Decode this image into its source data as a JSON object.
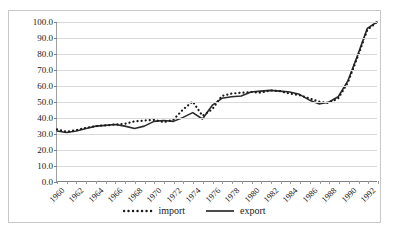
{
  "chart_data": {
    "type": "line",
    "title": "",
    "xlabel": "",
    "ylabel": "",
    "ylim": [
      0,
      100
    ],
    "xlim": [
      1960,
      1993
    ],
    "grid": true,
    "legend_position": "bottom",
    "ytick_labels": [
      "100.0",
      "90.0",
      "80.0",
      "70.0",
      "60.0",
      "50.0",
      "40.0",
      "30.0",
      "20.0",
      "10.0",
      "0.0"
    ],
    "ytick_values": [
      100,
      90,
      80,
      70,
      60,
      50,
      40,
      30,
      20,
      10,
      0
    ],
    "xtick_labels": [
      "1960",
      "1962",
      "1964",
      "1966",
      "1968",
      "1970",
      "1972",
      "1974",
      "1976",
      "1978",
      "1980",
      "1982",
      "1984",
      "1986",
      "1988",
      "1990",
      "1992"
    ],
    "x": [
      1960,
      1961,
      1962,
      1963,
      1964,
      1965,
      1966,
      1967,
      1968,
      1969,
      1970,
      1971,
      1972,
      1973,
      1974,
      1975,
      1976,
      1977,
      1978,
      1979,
      1980,
      1981,
      1982,
      1983,
      1984,
      1985,
      1986,
      1987,
      1988,
      1989,
      1990,
      1991,
      1992,
      1993
    ],
    "series": [
      {
        "name": "import",
        "style": "dotted",
        "color": "#1a1a1a",
        "values": [
          32.5,
          31.0,
          32.0,
          33.5,
          34.5,
          35.0,
          35.5,
          36.0,
          37.5,
          38.0,
          38.5,
          37.0,
          38.5,
          45.0,
          50.0,
          41.0,
          45.0,
          53.5,
          55.0,
          55.5,
          56.0,
          55.5,
          57.0,
          56.5,
          55.0,
          54.0,
          52.0,
          50.0,
          49.0,
          52.0,
          62.0,
          78.0,
          95.0,
          100.0
        ]
      },
      {
        "name": "export",
        "style": "solid",
        "color": "#2b2b2b",
        "values": [
          31.5,
          30.5,
          31.5,
          33.0,
          34.5,
          35.0,
          35.5,
          34.5,
          33.0,
          34.5,
          37.5,
          38.0,
          37.5,
          40.0,
          43.0,
          39.0,
          47.5,
          52.0,
          53.0,
          53.5,
          56.0,
          56.5,
          57.0,
          56.5,
          56.0,
          54.5,
          51.0,
          48.5,
          49.5,
          53.0,
          63.0,
          79.0,
          96.0,
          100.0
        ]
      }
    ],
    "legend": [
      {
        "label": "import",
        "style": "dotted"
      },
      {
        "label": "export",
        "style": "solid"
      }
    ]
  }
}
